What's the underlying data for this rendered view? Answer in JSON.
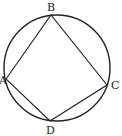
{
  "diagram": {
    "type": "cyclic-quadrilateral",
    "labels": {
      "A": "A",
      "B": "B",
      "C": "C",
      "D": "D"
    },
    "circle": {
      "cx": 57,
      "cy": 68,
      "r": 53
    },
    "points": {
      "A": [
        6,
        79
      ],
      "B": [
        51,
        15
      ],
      "C": [
        107,
        85
      ],
      "D": [
        50,
        121
      ]
    },
    "stroke": "#222222"
  }
}
